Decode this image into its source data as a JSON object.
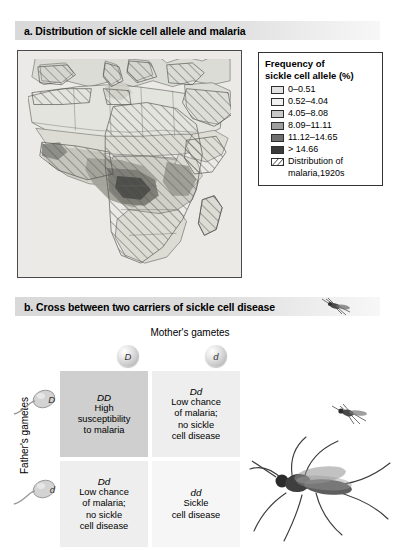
{
  "figure": {
    "sections": [
      {
        "id": "a",
        "title": "a. Distribution of sickle cell allele and malaria"
      },
      {
        "id": "b",
        "title": "b. Cross between two carriers of sickle cell disease"
      }
    ]
  },
  "legend": {
    "title_line1": "Frequency of",
    "title_line2": "sickle cell allele (%)",
    "entries": [
      {
        "label": "0–0.51",
        "color": "#e2e2e2"
      },
      {
        "label": "0.52–4.04",
        "color": "#f0f0f0"
      },
      {
        "label": "4.05–8.08",
        "color": "#c8c8c8"
      },
      {
        "label": "8.09–11.11",
        "color": "#9e9e9e"
      },
      {
        "label": "11.12–14.65",
        "color": "#6f6f6f"
      },
      {
        "label": "> 14.66",
        "color": "#3a3a3a"
      }
    ],
    "hatch_entry": {
      "label_line1": "Distribution of",
      "label_line2": "malaria,1920s"
    }
  },
  "punnett": {
    "mothers_label": "Mother's gametes",
    "fathers_label": "Father's gametes",
    "mother_gametes": [
      {
        "allele": "D"
      },
      {
        "allele": "d"
      }
    ],
    "father_gametes": [
      {
        "allele": "D"
      },
      {
        "allele": "d"
      }
    ],
    "cells": [
      {
        "position": "top-left",
        "genotype": "DD",
        "text_line1": "High",
        "text_line2": "susceptibility",
        "text_line3": "to malaria",
        "color": "#cfcfcf"
      },
      {
        "position": "top-right",
        "genotype": "Dd",
        "text_line1": "Low chance",
        "text_line2": "of malaria;",
        "text_line3": "no sickle",
        "text_line4": "cell disease",
        "color": "#eeeeee"
      },
      {
        "position": "bottom-left",
        "genotype": "Dd",
        "text_line1": "Low chance",
        "text_line2": "of malaria;",
        "text_line3": "no sickle",
        "text_line4": "cell disease",
        "color": "#eeeeee"
      },
      {
        "position": "bottom-right",
        "genotype": "dd",
        "text_line1": "Sickle",
        "text_line2": "cell disease",
        "color": "#f6f6f6"
      }
    ]
  },
  "illustrations": {
    "mosquito_header": "mosquito-icon",
    "mosquito_small": "mosquito-icon",
    "mosquito_large": "mosquito-icon",
    "map": "africa-malaria-map"
  }
}
